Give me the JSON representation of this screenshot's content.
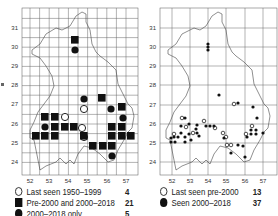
{
  "maps": [
    {
      "id": "left",
      "x_ticks": [
        "52",
        "53",
        "54",
        "55",
        "56",
        "57"
      ],
      "y_ticks": [
        "31",
        "30",
        "29",
        "28",
        "27",
        "26",
        "25",
        "24"
      ],
      "legend": [
        {
          "symbol": "open-circle",
          "label": "Last seen 1950–1999",
          "count": "4"
        },
        {
          "symbol": "filled-square",
          "label": "Pre-2000 and 2000–2018",
          "count": "21"
        },
        {
          "symbol": "filled-circle",
          "label": "2000–2018 only",
          "count": "5"
        }
      ]
    },
    {
      "id": "right",
      "x_ticks": [
        "52",
        "53",
        "54",
        "55",
        "56",
        "57"
      ],
      "y_ticks": [
        "31",
        "30",
        "29",
        "28",
        "27",
        "26",
        "25",
        "24"
      ],
      "legend": [
        {
          "symbol": "open-circle",
          "label": "Last seen pre-2000",
          "count": "13"
        },
        {
          "symbol": "filled-circle",
          "label": "Seen 2000–2018",
          "count": "37"
        }
      ]
    }
  ],
  "colors": {
    "ink": "#111111",
    "grid": "#555555",
    "outline": "#444444",
    "background": "#ffffff"
  }
}
